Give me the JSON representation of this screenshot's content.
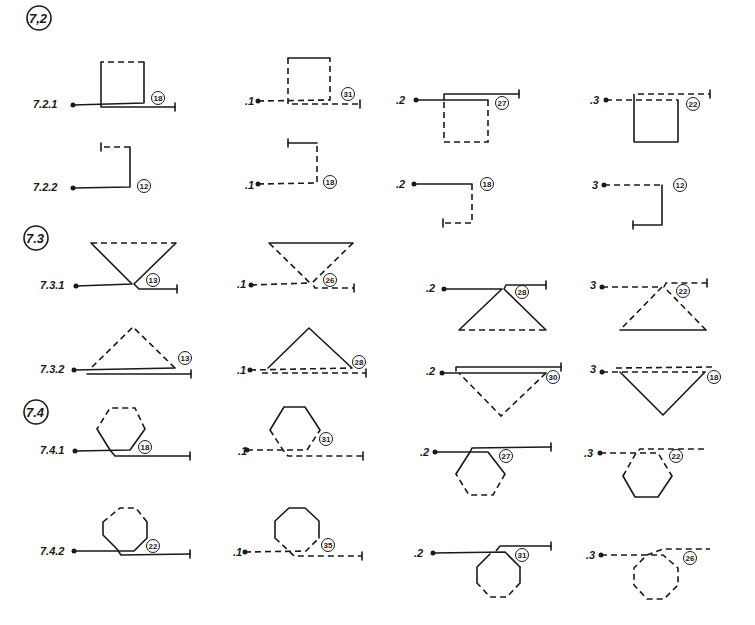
{
  "colors": {
    "ink": "#1a1a1a",
    "paper": "#ffffff"
  },
  "sections": [
    {
      "id": "7.2",
      "label": "7,2",
      "x": 28,
      "y": 22
    },
    {
      "id": "7.3",
      "label": "7.3",
      "x": 24,
      "y": 242
    },
    {
      "id": "7.4",
      "label": "7.4",
      "x": 24,
      "y": 412
    }
  ],
  "row_labels": [
    {
      "text": "7.2.1",
      "x": 33,
      "y": 108
    },
    {
      "text": ".1",
      "x": 245,
      "y": 102
    },
    {
      "text": ".2",
      "x": 396,
      "y": 104
    },
    {
      "text": ".3",
      "x": 590,
      "y": 104
    },
    {
      "text": "7.2.2",
      "x": 33,
      "y": 190
    },
    {
      "text": ".1",
      "x": 245,
      "y": 186
    },
    {
      "text": ".2",
      "x": 396,
      "y": 188
    },
    {
      "text": "3",
      "x": 592,
      "y": 189
    },
    {
      "text": "7.3.1",
      "x": 40,
      "y": 289
    },
    {
      "text": ".1",
      "x": 237,
      "y": 286
    },
    {
      "text": ".2",
      "x": 426,
      "y": 292
    },
    {
      "text": "3",
      "x": 590,
      "y": 289
    },
    {
      "text": "7.3.2",
      "x": 40,
      "y": 373
    },
    {
      "text": ".1",
      "x": 237,
      "y": 372
    },
    {
      "text": ".2",
      "x": 426,
      "y": 374
    },
    {
      "text": "3",
      "x": 590,
      "y": 373
    },
    {
      "text": "7.4.1",
      "x": 40,
      "y": 453
    },
    {
      "text": ".1",
      "x": 238,
      "y": 453
    },
    {
      "text": ".2",
      "x": 420,
      "y": 455
    },
    {
      "text": ".3",
      "x": 584,
      "y": 456
    },
    {
      "text": "7.4.2",
      "x": 40,
      "y": 554
    },
    {
      "text": ".1",
      "x": 233,
      "y": 555
    },
    {
      "text": ".2",
      "x": 414,
      "y": 556
    },
    {
      "text": ".3",
      "x": 586,
      "y": 558
    }
  ],
  "badges": [
    {
      "text": "18",
      "x": 158,
      "y": 99
    },
    {
      "text": "31",
      "x": 348,
      "y": 94
    },
    {
      "text": "27",
      "x": 502,
      "y": 103
    },
    {
      "text": "22",
      "x": 693,
      "y": 104
    },
    {
      "text": "12",
      "x": 144,
      "y": 186
    },
    {
      "text": "18",
      "x": 330,
      "y": 184
    },
    {
      "text": "18",
      "x": 487,
      "y": 184
    },
    {
      "text": "12",
      "x": 680,
      "y": 185
    },
    {
      "text": "13",
      "x": 153,
      "y": 280
    },
    {
      "text": "26",
      "x": 330,
      "y": 280
    },
    {
      "text": "28",
      "x": 522,
      "y": 292
    },
    {
      "text": "22",
      "x": 683,
      "y": 291
    },
    {
      "text": "13",
      "x": 185,
      "y": 358
    },
    {
      "text": "28",
      "x": 359,
      "y": 362
    },
    {
      "text": "30",
      "x": 553,
      "y": 377
    },
    {
      "text": "18",
      "x": 714,
      "y": 377
    },
    {
      "text": "18",
      "x": 145,
      "y": 447
    },
    {
      "text": "31",
      "x": 326,
      "y": 439
    },
    {
      "text": "27",
      "x": 506,
      "y": 456
    },
    {
      "text": "22",
      "x": 676,
      "y": 456
    },
    {
      "text": "22",
      "x": 153,
      "y": 546
    },
    {
      "text": "35",
      "x": 328,
      "y": 545
    },
    {
      "text": "31",
      "x": 522,
      "y": 555
    },
    {
      "text": "26",
      "x": 690,
      "y": 558
    }
  ],
  "figures": [
    {
      "id": "7.2.1",
      "shape": "square",
      "path_style": "solid",
      "badge": "18"
    },
    {
      "id": "7.2.1.1",
      "shape": "square",
      "path_style": "dashed",
      "badge": "31"
    },
    {
      "id": "7.2.1.2",
      "shape": "square",
      "path_style": "solid-dashed",
      "badge": "27"
    },
    {
      "id": "7.2.1.3",
      "shape": "square",
      "path_style": "dashed-solid",
      "badge": "22"
    },
    {
      "id": "7.2.2",
      "shape": "corner",
      "path_style": "solid-dashed",
      "badge": "12"
    },
    {
      "id": "7.2.2.1",
      "shape": "corner",
      "path_style": "dashed-solid",
      "badge": "18"
    },
    {
      "id": "7.2.2.2",
      "shape": "corner",
      "path_style": "solid-dashed",
      "badge": "18"
    },
    {
      "id": "7.2.2.3",
      "shape": "corner",
      "path_style": "dashed-solid",
      "badge": "12"
    },
    {
      "id": "7.3.1",
      "shape": "triangle-down",
      "path_style": "solid",
      "badge": "13"
    },
    {
      "id": "7.3.1.1",
      "shape": "triangle-down",
      "path_style": "dashed",
      "badge": "26"
    },
    {
      "id": "7.3.1.2",
      "shape": "triangle-up",
      "path_style": "solid",
      "badge": "28"
    },
    {
      "id": "7.3.1.3",
      "shape": "triangle-up",
      "path_style": "dashed",
      "badge": "22"
    },
    {
      "id": "7.3.2",
      "shape": "triangle-up",
      "path_style": "solid",
      "badge": "13"
    },
    {
      "id": "7.3.2.1",
      "shape": "triangle-up",
      "path_style": "dashed",
      "badge": "28"
    },
    {
      "id": "7.3.2.2",
      "shape": "triangle-down",
      "path_style": "solid",
      "badge": "30"
    },
    {
      "id": "7.3.2.3",
      "shape": "triangle-down",
      "path_style": "dashed",
      "badge": "18"
    },
    {
      "id": "7.4.1",
      "shape": "hexagon",
      "path_style": "solid",
      "badge": "18"
    },
    {
      "id": "7.4.1.1",
      "shape": "hexagon",
      "path_style": "dashed",
      "badge": "31"
    },
    {
      "id": "7.4.1.2",
      "shape": "hexagon",
      "path_style": "solid",
      "badge": "27"
    },
    {
      "id": "7.4.1.3",
      "shape": "hexagon",
      "path_style": "dashed",
      "badge": "22"
    },
    {
      "id": "7.4.2",
      "shape": "octagon",
      "path_style": "solid",
      "badge": "22"
    },
    {
      "id": "7.4.2.1",
      "shape": "octagon",
      "path_style": "dashed",
      "badge": "35"
    },
    {
      "id": "7.4.2.2",
      "shape": "octagon",
      "path_style": "solid",
      "badge": "31"
    },
    {
      "id": "7.4.2.3",
      "shape": "octagon",
      "path_style": "dashed",
      "badge": "26"
    }
  ]
}
